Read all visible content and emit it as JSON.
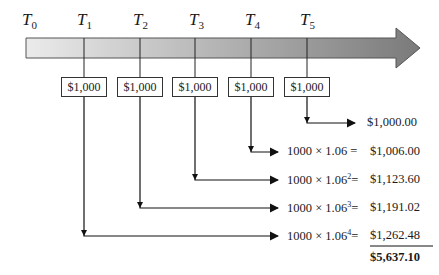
{
  "timeline": {
    "labels": [
      {
        "base": "T",
        "sub": "0"
      },
      {
        "base": "T",
        "sub": "1"
      },
      {
        "base": "T",
        "sub": "2"
      },
      {
        "base": "T",
        "sub": "3"
      },
      {
        "base": "T",
        "sub": "4"
      },
      {
        "base": "T",
        "sub": "5"
      }
    ],
    "arrow_gradient": [
      "#e6e6e6",
      "#7f7f7f"
    ]
  },
  "deposits": [
    "$1,000",
    "$1,000",
    "$1,000",
    "$1,000",
    "$1,000"
  ],
  "rows": [
    {
      "expr": "",
      "exp": "",
      "eq": "",
      "value": "$1,000.00"
    },
    {
      "expr": "1000 × 1.06",
      "exp": "",
      "eq": " = ",
      "value": "$1,006.00"
    },
    {
      "expr": "1000 × 1.06",
      "exp": "2",
      "eq": "= ",
      "value": "$1,123.60"
    },
    {
      "expr": "1000 × 1.06",
      "exp": "3",
      "eq": "= ",
      "value": "$1,191.02"
    },
    {
      "expr": "1000 × 1.06",
      "exp": "4",
      "eq": "= ",
      "value": "$1,262.48"
    }
  ],
  "total": "$5,637.10"
}
